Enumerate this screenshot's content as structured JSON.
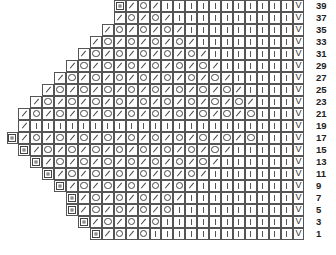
{
  "chart": {
    "columns": 25,
    "row_height": 12,
    "cell_width": 11.92,
    "legend_symbols": {
      "B": "box-stitch-icon",
      "/": "k2tog-slash-icon",
      "O": "yarn-over-circle-icon",
      "|": "knit-bar-icon",
      "V": "slip-v-icon",
      ".": "empty"
    },
    "v_glyph": "V",
    "rows": [
      {
        "label": "39",
        "cells": ".........B/O/|||||||||||V"
      },
      {
        "label": "37",
        "cells": "........./O/O/||||||||||V"
      },
      {
        "label": "35",
        "cells": "......../O/O/O/|||||||||V"
      },
      {
        "label": "33",
        "cells": "......./O/O/O/O/||||||||V"
      },
      {
        "label": "31",
        "cells": "....../O/O/O/O/O/|||||||V"
      },
      {
        "label": "29",
        "cells": "...../O/O/O/O/O/O/||||||V"
      },
      {
        "label": "27",
        "cells": "..../O/O/O/O/O/O/O/|||||V"
      },
      {
        "label": "25",
        "cells": ".../O/O/O/O/O/O/O/O/||||V"
      },
      {
        "label": "23",
        "cells": "../O/O/O/O/O/O/O/O/O/|||V"
      },
      {
        "label": "21",
        "cells": "./O/O/O/O/O/O/O/O/O/O|||V"
      },
      {
        "label": "19",
        "cells": "./||||||||||||||||||||||V"
      },
      {
        "label": "17",
        "cells": "B/O/O/O/O/O/O/O/O/O/O|||V"
      },
      {
        "label": "15",
        "cells": ".B/O/O/O/O/O/O/O/O/|||||V"
      },
      {
        "label": "13",
        "cells": "..B/O/O/O/O/O/O/O/||||||V"
      },
      {
        "label": "11",
        "cells": "...B/O/O/O/O/O/O/|||||||V"
      },
      {
        "label": "9",
        "cells": "....B/O/O/O/O/O/||||||||V"
      },
      {
        "label": "7",
        "cells": ".....B/O/O/O/O/|||||||||V"
      },
      {
        "label": "5",
        "cells": "......B/O/O/O/O||||||||||V"
      },
      {
        "label": "3",
        "cells": ".......B/O/O/O|||||||||||V"
      },
      {
        "label": "1",
        "cells": "........B/O/O||||||||||||V"
      }
    ]
  }
}
